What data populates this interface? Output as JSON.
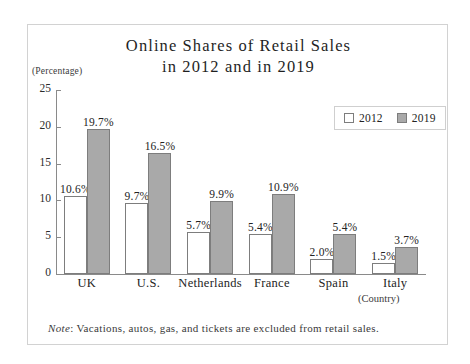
{
  "chart_data": {
    "type": "bar",
    "title": "Online Shares of Retail Sales in 2012 and in 2019",
    "title_line1": "Online Shares of Retail Sales",
    "title_line2": "in 2012 and in 2019",
    "unit_label": "(Percentage)",
    "xlabel": "(Country)",
    "ylabel": "",
    "ylim": [
      0,
      25
    ],
    "yticks": [
      0,
      5,
      10,
      15,
      20,
      25
    ],
    "grid": false,
    "legend_position": "top-right",
    "categories": [
      "UK",
      "U.S.",
      "Netherlands",
      "France",
      "Spain",
      "Italy"
    ],
    "series": [
      {
        "name": "2012",
        "color": "#ffffff",
        "values": [
          10.6,
          9.7,
          5.7,
          5.4,
          2.0,
          1.5
        ],
        "labels": [
          "10.6%",
          "9.7%",
          "5.7%",
          "5.4%",
          "2.0%",
          "1.5%"
        ]
      },
      {
        "name": "2019",
        "color": "#a9a9a9",
        "values": [
          19.7,
          16.5,
          9.9,
          10.9,
          5.4,
          3.7
        ],
        "labels": [
          "19.7%",
          "16.5%",
          "9.9%",
          "10.9%",
          "5.4%",
          "3.7%"
        ]
      }
    ],
    "note_word": "Note",
    "note_text": ": Vacations, autos, gas, and tickets are excluded from retail sales."
  }
}
